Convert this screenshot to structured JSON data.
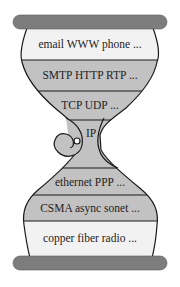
{
  "diagram": {
    "colors": {
      "bar": "#7d7d7d",
      "light_band": "#f2f2f2",
      "dark_band": "#c2c2c2",
      "outline": "#1a1a1a",
      "background": "#ffffff"
    },
    "layers": [
      {
        "label": "email WWW phone ..."
      },
      {
        "label": "SMTP HTTP RTP ..."
      },
      {
        "label": "TCP UDP ..."
      },
      {
        "label": "IP"
      },
      {
        "label": "ethernet PPP ..."
      },
      {
        "label": "CSMA async sonet ..."
      },
      {
        "label": "copper fiber radio ..."
      }
    ]
  }
}
